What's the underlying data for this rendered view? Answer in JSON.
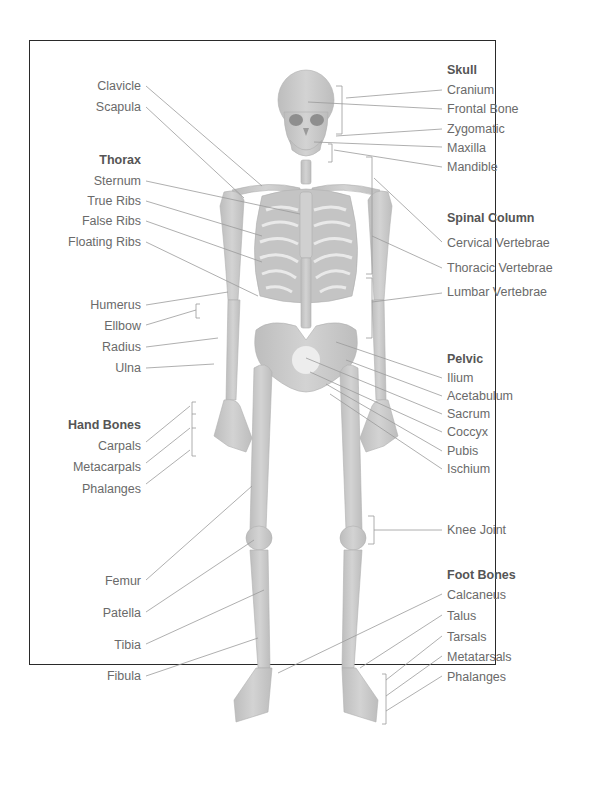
{
  "diagram": {
    "left_labels": {
      "clavicle": "Clavicle",
      "scapula": "Scapula",
      "thorax_heading": "Thorax",
      "sternum": "Sternum",
      "true_ribs": "True Ribs",
      "false_ribs": "False Ribs",
      "floating_ribs": "Floating Ribs",
      "humerus": "Humerus",
      "elbow": "Ellbow",
      "radius": "Radius",
      "ulna": "Ulna",
      "hand_heading": "Hand Bones",
      "carpals": "Carpals",
      "metacarpals": "Metacarpals",
      "phalanges": "Phalanges",
      "femur": "Femur",
      "patella": "Patella",
      "tibia": "Tibia",
      "fibula": "Fibula"
    },
    "right_labels": {
      "skull_heading": "Skull",
      "cranium": "Cranium",
      "frontal_bone": "Frontal Bone",
      "zygomatic": "Zygomatic",
      "maxilla": "Maxilla",
      "mandible": "Mandible",
      "spinal_heading": "Spinal Column",
      "cervical": "Cervical Vertebrae",
      "thoracic": "Thoracic Vertebrae",
      "lumbar": "Lumbar Vertebrae",
      "pelvic_heading": "Pelvic",
      "ilium": "Ilium",
      "acetabulum": "Acetabulum",
      "sacrum": "Sacrum",
      "coccyx": "Coccyx",
      "pubis": "Pubis",
      "ischium": "Ischium",
      "knee_joint": "Knee Joint",
      "foot_heading": "Foot Bones",
      "calcaneus": "Calcaneus",
      "talus": "Talus",
      "tarsals": "Tarsals",
      "metatarsals": "Metatarsals",
      "foot_phalanges": "Phalanges"
    },
    "colors": {
      "bone": "#c9c9c9",
      "bone_dark": "#a8a8a8",
      "leader_line": "#9a9a9a",
      "label_text": "#6a6a6a",
      "heading_text": "#555555",
      "frame_border": "#2a2a2a"
    }
  }
}
